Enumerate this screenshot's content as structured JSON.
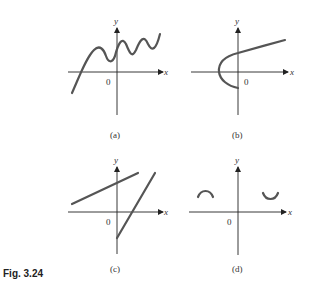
{
  "figure": {
    "label": "Fig. 3.24",
    "panels": [
      {
        "id": "a",
        "caption": "(a)",
        "x_label": "x",
        "y_label": "y",
        "origin_label": "0",
        "description": "wavy increasing curve crossing x-axis once"
      },
      {
        "id": "b",
        "caption": "(b)",
        "x_label": "x",
        "y_label": "y",
        "origin_label": "0",
        "description": "sideways parabola opening right"
      },
      {
        "id": "c",
        "caption": "(c)",
        "x_label": "x",
        "y_label": "y",
        "origin_label": "0",
        "description": "two disjoint line segments"
      },
      {
        "id": "d",
        "caption": "(d)",
        "x_label": "x",
        "y_label": "y",
        "origin_label": "0",
        "description": "two small arcs, one concave down left, one concave up right"
      }
    ]
  }
}
